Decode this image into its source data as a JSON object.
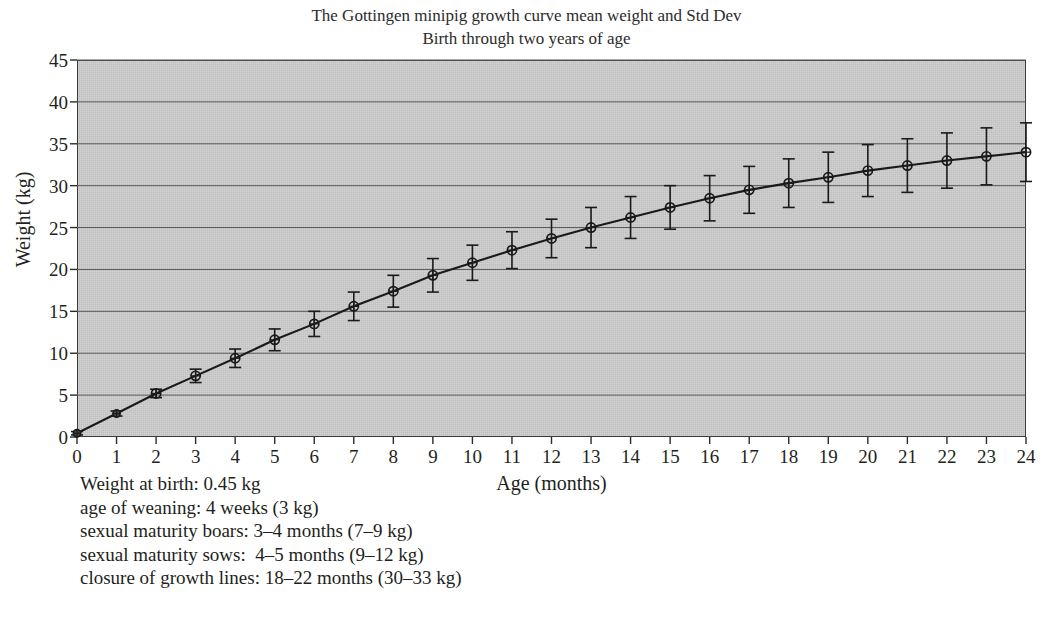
{
  "title": {
    "line1": "The Gottingen minipig growth curve mean weight and Std Dev",
    "line2": "Birth through two years of age"
  },
  "axes": {
    "x_title": "Age (months)",
    "y_title": "Weight (kg)"
  },
  "footnotes": [
    "Weight at birth: 0.45 kg",
    "age of weaning: 4 weeks (3 kg)",
    "sexual maturity boars: 3–4 months (7–9 kg)",
    "sexual maturity sows:  4–5 months (9–12 kg)",
    "closure of growth lines: 18–22 months (30–33 kg)"
  ],
  "colors": {
    "plot_background": "#bfbfbf",
    "gridline": "#595959",
    "series_line": "#1a1a1a",
    "frame": "#3a3a3a",
    "text": "#231f20"
  },
  "chart_data": {
    "type": "line",
    "xlabel": "Age (months)",
    "ylabel": "Weight (kg)",
    "xlim": [
      0,
      24
    ],
    "ylim": [
      0,
      45
    ],
    "xticks": [
      0,
      1,
      2,
      3,
      4,
      5,
      6,
      7,
      8,
      9,
      10,
      11,
      12,
      13,
      14,
      15,
      16,
      17,
      18,
      19,
      20,
      21,
      22,
      23,
      24
    ],
    "yticks": [
      0,
      5,
      10,
      15,
      20,
      25,
      30,
      35,
      40,
      45
    ],
    "grid": true,
    "legend": "none",
    "error_bars": "std_dev",
    "marker": "circle-with-cross",
    "x": [
      0,
      1,
      2,
      3,
      4,
      5,
      6,
      7,
      8,
      9,
      10,
      11,
      12,
      13,
      14,
      15,
      16,
      17,
      18,
      19,
      20,
      21,
      22,
      23,
      24
    ],
    "values": [
      0.45,
      2.8,
      5.2,
      7.3,
      9.4,
      11.6,
      13.5,
      15.6,
      17.4,
      19.3,
      20.8,
      22.3,
      23.7,
      25.0,
      26.2,
      27.4,
      28.5,
      29.5,
      30.3,
      31.0,
      31.8,
      32.4,
      33.0,
      33.5,
      34.0
    ],
    "errors": [
      0.2,
      0.3,
      0.5,
      0.8,
      1.1,
      1.3,
      1.5,
      1.7,
      1.9,
      2.0,
      2.1,
      2.2,
      2.3,
      2.4,
      2.5,
      2.6,
      2.7,
      2.8,
      2.9,
      3.0,
      3.1,
      3.2,
      3.3,
      3.4,
      3.5
    ],
    "series": [
      {
        "name": "Mean weight",
        "values": [
          0.45,
          2.8,
          5.2,
          7.3,
          9.4,
          11.6,
          13.5,
          15.6,
          17.4,
          19.3,
          20.8,
          22.3,
          23.7,
          25.0,
          26.2,
          27.4,
          28.5,
          29.5,
          30.3,
          31.0,
          31.8,
          32.4,
          33.0,
          33.5,
          34.0
        ]
      }
    ]
  }
}
